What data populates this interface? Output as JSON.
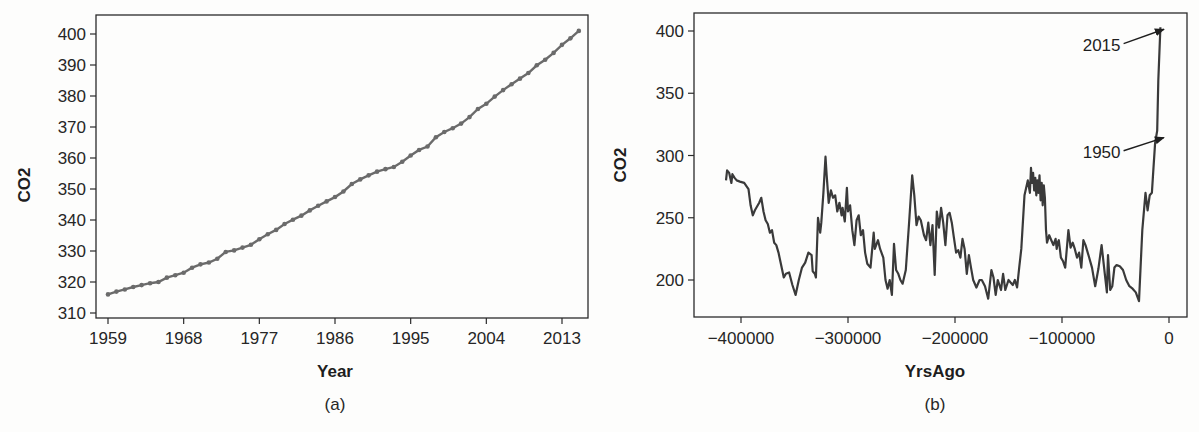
{
  "chart_data": [
    {
      "type": "line",
      "panel_label": "(a)",
      "title": "",
      "xlabel": "Year",
      "ylabel": "CO2",
      "xlim": [
        1957.5,
        2016.5
      ],
      "ylim": [
        308,
        406
      ],
      "xticks": [
        1959,
        1968,
        1977,
        1986,
        1995,
        2004,
        2013
      ],
      "yticks": [
        310,
        320,
        330,
        340,
        350,
        360,
        370,
        380,
        390,
        400
      ],
      "grid": false,
      "legend": null,
      "markers": true,
      "line_color": "#6b6b6b",
      "x": [
        1959,
        1960,
        1961,
        1962,
        1963,
        1964,
        1965,
        1966,
        1967,
        1968,
        1969,
        1970,
        1971,
        1972,
        1973,
        1974,
        1975,
        1976,
        1977,
        1978,
        1979,
        1980,
        1981,
        1982,
        1983,
        1984,
        1985,
        1986,
        1987,
        1988,
        1989,
        1990,
        1991,
        1992,
        1993,
        1994,
        1995,
        1996,
        1997,
        1998,
        1999,
        2000,
        2001,
        2002,
        2003,
        2004,
        2005,
        2006,
        2007,
        2008,
        2009,
        2010,
        2011,
        2012,
        2013,
        2014,
        2015
      ],
      "values": [
        316.0,
        316.9,
        317.6,
        318.4,
        319.0,
        319.6,
        320.0,
        321.4,
        322.2,
        323.0,
        324.6,
        325.7,
        326.3,
        327.5,
        329.7,
        330.2,
        331.1,
        332.0,
        333.8,
        335.4,
        336.8,
        338.7,
        340.1,
        341.4,
        343.1,
        344.6,
        346.0,
        347.4,
        349.2,
        351.6,
        353.1,
        354.4,
        355.6,
        356.4,
        357.1,
        358.8,
        360.8,
        362.6,
        363.7,
        366.7,
        368.4,
        369.6,
        371.1,
        373.2,
        375.8,
        377.5,
        379.8,
        381.9,
        383.8,
        385.6,
        387.4,
        389.9,
        391.7,
        393.9,
        396.5,
        398.6,
        401.0
      ]
    },
    {
      "type": "line",
      "panel_label": "(b)",
      "title": "",
      "xlabel": "YrsAgo",
      "ylabel": "CO2",
      "xlim": [
        -443000,
        12000
      ],
      "ylim": [
        171,
        414
      ],
      "xticks": [
        -400000,
        -300000,
        -200000,
        -100000,
        0
      ],
      "xtick_labels": [
        "−400000",
        "−300000",
        "−200000",
        "−100000",
        "0"
      ],
      "yticks": [
        200,
        250,
        300,
        350,
        400
      ],
      "grid": false,
      "legend": null,
      "line_color": "#3a3a3a",
      "annotations": [
        {
          "text": "2015",
          "x": -1000,
          "y": 403,
          "text_x": -63000,
          "text_y": 389
        },
        {
          "text": "1950",
          "x": -1000,
          "y": 316,
          "text_x": -63000,
          "text_y": 303
        }
      ],
      "x": [
        -414000,
        -413000,
        -411000,
        -409000,
        -408000,
        -406000,
        -404000,
        -401000,
        -397000,
        -393000,
        -391000,
        -389000,
        -387000,
        -383000,
        -381000,
        -379000,
        -377000,
        -375000,
        -373000,
        -371000,
        -369000,
        -367000,
        -365000,
        -363000,
        -360000,
        -358000,
        -355000,
        -352000,
        -349000,
        -346000,
        -343000,
        -340000,
        -337000,
        -334000,
        -333000,
        -331000,
        -330000,
        -328000,
        -326000,
        -325000,
        -323000,
        -321000,
        -320000,
        -318000,
        -316000,
        -314000,
        -312000,
        -310000,
        -308000,
        -306000,
        -305000,
        -303000,
        -301000,
        -300000,
        -298000,
        -296000,
        -294000,
        -292000,
        -290000,
        -288000,
        -286000,
        -284000,
        -282000,
        -279000,
        -276000,
        -275000,
        -272000,
        -270000,
        -267000,
        -265000,
        -263000,
        -261000,
        -259000,
        -257000,
        -255000,
        -253000,
        -251000,
        -249000,
        -246000,
        -243000,
        -240000,
        -238000,
        -236000,
        -234000,
        -232000,
        -229000,
        -227000,
        -225000,
        -223000,
        -221000,
        -219000,
        -217000,
        -215000,
        -213000,
        -211000,
        -209000,
        -207000,
        -205000,
        -203000,
        -201000,
        -199000,
        -197000,
        -195000,
        -193000,
        -191000,
        -189000,
        -187000,
        -185000,
        -183000,
        -180000,
        -177000,
        -175000,
        -172000,
        -169000,
        -166000,
        -164000,
        -162000,
        -160000,
        -157000,
        -155000,
        -153000,
        -150000,
        -148000,
        -146000,
        -144000,
        -142000,
        -140000,
        -138000,
        -135000,
        -132000,
        -130000,
        -129000,
        -128000,
        -127000,
        -126000,
        -125000,
        -124000,
        -123000,
        -122000,
        -121000,
        -120000,
        -119000,
        -118000,
        -117000,
        -116000,
        -115000,
        -114000,
        -112000,
        -110000,
        -108000,
        -106000,
        -105000,
        -104000,
        -103000,
        -101000,
        -99000,
        -97000,
        -94000,
        -92000,
        -90000,
        -88000,
        -86000,
        -84000,
        -82000,
        -80000,
        -78000,
        -75000,
        -72000,
        -69000,
        -66000,
        -63000,
        -60000,
        -58000,
        -57000,
        -55000,
        -53000,
        -51000,
        -49000,
        -46000,
        -43000,
        -40000,
        -37000,
        -34000,
        -31000,
        -28000,
        -25000,
        -22000,
        -20000,
        -18000,
        -16000,
        -15000,
        -13000,
        -11000,
        -10000,
        -8000,
        -6000,
        -4000,
        -2000,
        -1000,
        -500
      ],
      "values": [
        280,
        288,
        286,
        278,
        285,
        282,
        280,
        279,
        278,
        273,
        260,
        252,
        256,
        262,
        266,
        255,
        248,
        245,
        238,
        240,
        230,
        228,
        222,
        214,
        202,
        205,
        206,
        196,
        188,
        200,
        210,
        214,
        222,
        220,
        207,
        205,
        202,
        250,
        238,
        246,
        270,
        299,
        285,
        262,
        272,
        266,
        268,
        255,
        262,
        252,
        258,
        247,
        274,
        255,
        260,
        240,
        228,
        248,
        252,
        236,
        240,
        222,
        213,
        210,
        238,
        225,
        232,
        225,
        218,
        200,
        193,
        200,
        188,
        229,
        208,
        205,
        200,
        197,
        208,
        245,
        284,
        268,
        244,
        251,
        248,
        236,
        232,
        246,
        228,
        244,
        204,
        255,
        242,
        258,
        246,
        228,
        252,
        254,
        246,
        234,
        222,
        224,
        218,
        233,
        225,
        205,
        220,
        210,
        200,
        194,
        200,
        200,
        195,
        185,
        208,
        202,
        188,
        200,
        192,
        205,
        192,
        200,
        198,
        196,
        200,
        194,
        210,
        225,
        268,
        280,
        270,
        290,
        278,
        286,
        272,
        282,
        268,
        280,
        270,
        284,
        264,
        278,
        260,
        276,
        266,
        240,
        230,
        236,
        232,
        228,
        233,
        225,
        230,
        232,
        218,
        215,
        210,
        240,
        226,
        230,
        225,
        218,
        222,
        210,
        232,
        228,
        219,
        210,
        195,
        209,
        228,
        205,
        190,
        220,
        192,
        195,
        210,
        212,
        211,
        208,
        200,
        195,
        193,
        190,
        183,
        240,
        270,
        256,
        268,
        270,
        284,
        310,
        320,
        360,
        403
      ]
    }
  ],
  "figure": {
    "panels": [
      {
        "id": "a",
        "label": "(a)",
        "xlabel": "Year",
        "ylabel": "CO2"
      },
      {
        "id": "b",
        "label": "(b)",
        "xlabel": "YrsAgo",
        "ylabel": "CO2"
      }
    ]
  }
}
